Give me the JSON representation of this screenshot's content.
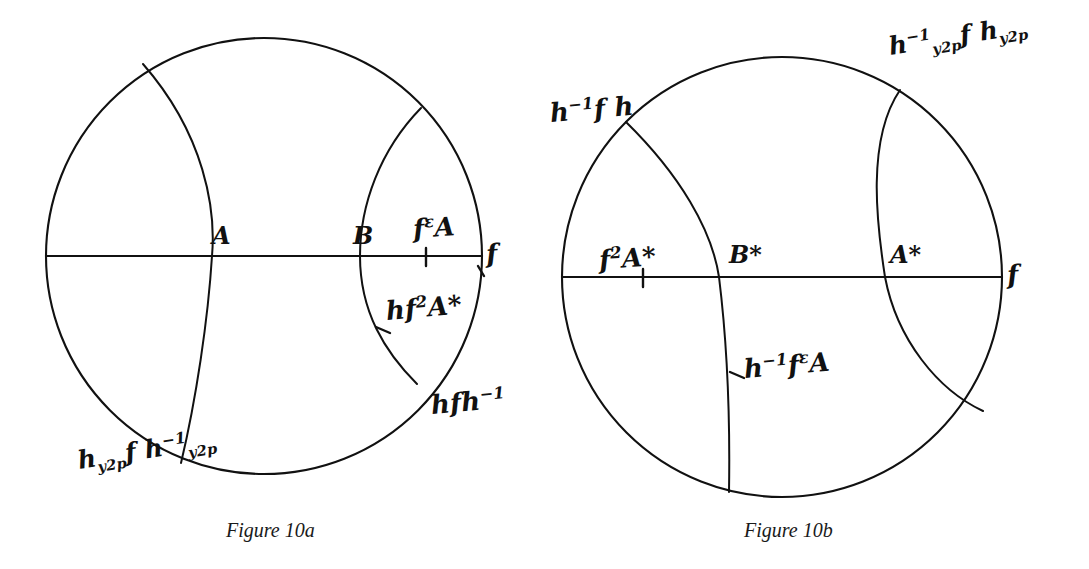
{
  "page": {
    "background_color": "#ffffff",
    "ink_color": "#111111",
    "width": 1089,
    "height": 569
  },
  "figures": [
    {
      "id": "figure-10a",
      "caption": "Figure 10a",
      "disk": {
        "cx": 264,
        "cy": 256,
        "r": 218
      },
      "point_labels": [
        {
          "name": "point-A",
          "text": "A",
          "x": 212,
          "y": 224,
          "size": 24
        },
        {
          "name": "point-B",
          "text": "B",
          "x": 353,
          "y": 224,
          "size": 24
        }
      ],
      "hand_labels": [
        {
          "name": "label-f-epsilon-A",
          "html": "f<sup>ε</sup>A",
          "x": 414,
          "y": 216,
          "size": 26,
          "slant": "slant-4"
        },
        {
          "name": "label-axis-f-right",
          "html": "f",
          "x": 487,
          "y": 241,
          "size": 26,
          "slant": "slant-4"
        },
        {
          "name": "label-h-f2-A-star",
          "html": "hf<sup>2</sup>A*",
          "x": 387,
          "y": 298,
          "size": 26,
          "slant": "slant-3"
        },
        {
          "name": "label-h-f-h-inverse",
          "html": "hfh<sup>−1</sup>",
          "x": 432,
          "y": 392,
          "size": 26,
          "slant": "slant-3"
        },
        {
          "name": "label-h-y2p-f-h-y2p-inverse",
          "html": "h<sub>y2p</sub>f h<sup>−1</sup><sub>y2p</sub>",
          "x": 80,
          "y": 448,
          "size": 25,
          "slant": "slant-2"
        }
      ]
    },
    {
      "id": "figure-10b",
      "caption": "Figure 10b",
      "disk": {
        "cx": 782,
        "cy": 277,
        "r": 220
      },
      "point_labels": [
        {
          "name": "point-B-star",
          "text": "B*",
          "x": 729,
          "y": 243,
          "size": 24
        },
        {
          "name": "point-A-star",
          "text": "A*",
          "x": 890,
          "y": 243,
          "size": 24
        }
      ],
      "hand_labels": [
        {
          "name": "label-h-inverse-f-h",
          "html": "h<sup>−1</sup>f h",
          "x": 551,
          "y": 100,
          "size": 26,
          "slant": "slant-3"
        },
        {
          "name": "label-h-y2p-inverse-f-h-y2p",
          "html": "h<sup>−1</sup><sub>y2p</sub>f h<sub>y2p</sub>",
          "x": 891,
          "y": 34,
          "size": 25,
          "slant": "slant-2"
        },
        {
          "name": "label-f2-A-star",
          "html": "f<sup>2</sup>A*",
          "x": 600,
          "y": 247,
          "size": 26,
          "slant": "slant-4"
        },
        {
          "name": "label-axis-f-right",
          "html": "f",
          "x": 1008,
          "y": 262,
          "size": 26,
          "slant": "slant-4"
        },
        {
          "name": "label-h-inverse-f-epsilon-A",
          "html": "h<sup>−1</sup>f<sup>ε</sup>A",
          "x": 745,
          "y": 356,
          "size": 26,
          "slant": "slant-3"
        }
      ]
    }
  ],
  "captions": {
    "left": {
      "text": "Figure 10a",
      "x": 226,
      "y": 519
    },
    "right": {
      "text": "Figure 10b",
      "x": 744,
      "y": 519
    }
  },
  "chart_data": {
    "type": "diagram",
    "figures": [
      {
        "label": "Figure 10a",
        "disk": {
          "cx": 264,
          "cy": 256,
          "r": 218
        },
        "diameter_axis": {
          "from": [
            46,
            256
          ],
          "to": [
            482,
            256
          ],
          "label": "f"
        },
        "geodesics": [
          {
            "name": "left-geodesic",
            "endpoints_on_circle": [
              [
                143,
                64
              ],
              [
                181,
                463
              ]
            ],
            "bulge": "right",
            "labels": [
              "h_y2p f h^-1_y2p"
            ]
          },
          {
            "name": "right-geodesic",
            "endpoints_on_circle": [
              [
                421,
                108
              ],
              [
                417,
                384
              ]
            ],
            "bulge": "left",
            "labels": [
              "hfh^-1"
            ]
          }
        ],
        "marked_points": [
          {
            "name": "A",
            "position": [
              212,
              256
            ]
          },
          {
            "name": "B",
            "position": [
              360,
              256
            ]
          },
          {
            "name": "f^epsilon A",
            "position": [
              426,
              256
            ]
          },
          {
            "name": "hf^2 A*",
            "position": [
              383,
              330
            ]
          }
        ]
      },
      {
        "label": "Figure 10b",
        "disk": {
          "cx": 782,
          "cy": 277,
          "r": 220
        },
        "diameter_axis": {
          "from": [
            562,
            277
          ],
          "to": [
            1002,
            277
          ],
          "label": "f"
        },
        "geodesics": [
          {
            "name": "left-geodesic",
            "endpoints_on_circle": [
              [
                626,
                122
              ],
              [
                729,
                492
              ]
            ],
            "bulge": "right",
            "labels": [
              "h^-1 f h"
            ]
          },
          {
            "name": "right-geodesic",
            "endpoints_on_circle": [
              [
                900,
                90
              ],
              [
                983,
                411
              ]
            ],
            "bulge": "left",
            "labels": [
              "h^-1_y2p f h_y2p"
            ]
          }
        ],
        "marked_points": [
          {
            "name": "f^2 A*",
            "position": [
              643,
              277
            ]
          },
          {
            "name": "B*",
            "position": [
              719,
              277
            ]
          },
          {
            "name": "A*",
            "position": [
              885,
              277
            ]
          },
          {
            "name": "h^-1 f^epsilon A",
            "position": [
              737,
              380
            ]
          }
        ]
      }
    ]
  }
}
